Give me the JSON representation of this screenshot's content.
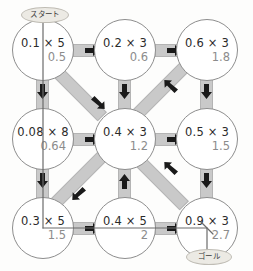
{
  "diagram": {
    "start_label": "スタート",
    "goal_label": "ゴール",
    "node_border_color": "#8d8d8d",
    "edge_color": "#c9c9c9",
    "result_color": "#8c8c8c",
    "nodes": [
      {
        "id": "r0c0",
        "expr": "0.1 × 5",
        "result": "0.5"
      },
      {
        "id": "r0c1",
        "expr": "0.2 × 3",
        "result": "0.6"
      },
      {
        "id": "r0c2",
        "expr": "0.6 × 3",
        "result": "1.8"
      },
      {
        "id": "r1c0",
        "expr": "0.08 × 8",
        "result": "0.64"
      },
      {
        "id": "r1c1",
        "expr": "0.4 × 3",
        "result": "1.2"
      },
      {
        "id": "r1c2",
        "expr": "0.5 × 3",
        "result": "1.5"
      },
      {
        "id": "r2c0",
        "expr": "0.3 × 5",
        "result": "1.5"
      },
      {
        "id": "r2c1",
        "expr": "0.4 × 5",
        "result": "2"
      },
      {
        "id": "r2c2",
        "expr": "0.9 × 3",
        "result": "2.7"
      }
    ],
    "edges": [
      {
        "id": "e-r0c0-r0c1",
        "direction": "right"
      },
      {
        "id": "e-r0c1-r0c2",
        "direction": "right"
      },
      {
        "id": "e-r1c0-r1c1",
        "direction": "right"
      },
      {
        "id": "e-r1c1-r1c2",
        "direction": "right"
      },
      {
        "id": "e-r2c0-r2c1",
        "direction": "right"
      },
      {
        "id": "e-r2c1-r2c2",
        "direction": "right"
      },
      {
        "id": "e-r0c0-r1c0",
        "direction": "down"
      },
      {
        "id": "e-r1c0-r2c0",
        "direction": "down"
      },
      {
        "id": "e-r0c1-r1c1",
        "direction": "down"
      },
      {
        "id": "e-r2c1-r1c1",
        "direction": "up"
      },
      {
        "id": "e-r0c2-r1c2",
        "direction": "down"
      },
      {
        "id": "e-r1c2-r2c2",
        "direction": "down"
      },
      {
        "id": "e-r0c0-r1c1",
        "direction": "down-right"
      },
      {
        "id": "e-r1c1-r0c2",
        "direction": "up-right"
      },
      {
        "id": "e-r1c1-r2c0",
        "direction": "down-left"
      },
      {
        "id": "e-r2c1-r1c2",
        "direction": "up-right"
      }
    ]
  }
}
